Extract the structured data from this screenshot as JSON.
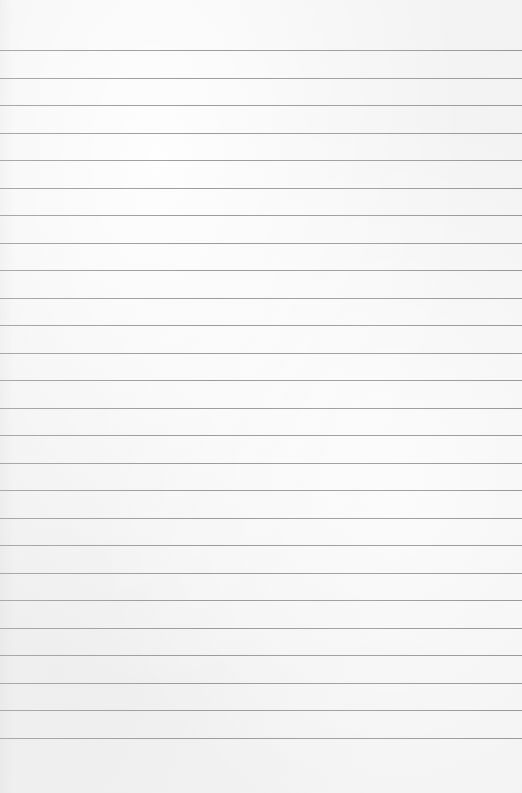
{
  "page": {
    "type": "lined-paper",
    "background_color": "#f3f3f3",
    "line_color": "#9e9e9e",
    "line_count": 26,
    "first_line_y": 50,
    "line_spacing": 27.5
  }
}
